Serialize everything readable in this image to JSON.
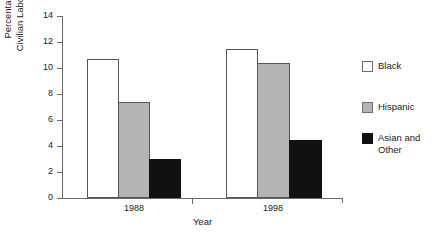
{
  "chart_data": {
    "type": "bar",
    "title": "",
    "xlabel": "Year",
    "ylabel": "Percentage of Civilian Labor Force",
    "ylabel_lines": [
      "Percentage of",
      "Civilian Labor Force"
    ],
    "categories": [
      "1988",
      "1998"
    ],
    "series": [
      {
        "name": "Black",
        "values": [
          10.7,
          11.5
        ],
        "color": "#ffffff"
      },
      {
        "name": "Hispanic",
        "values": [
          7.4,
          10.4
        ],
        "color": "#b4b4b4"
      },
      {
        "name": "Asian and Other",
        "values": [
          3.0,
          4.5
        ],
        "color": "#111111"
      }
    ],
    "ylim": [
      0,
      14
    ],
    "yticks": [
      0,
      2,
      4,
      6,
      8,
      10,
      12,
      14
    ],
    "ytick_labels": [
      "0",
      "2",
      "4",
      "6",
      "8",
      "10",
      "12",
      "14"
    ],
    "grid": false,
    "legend_position": "right",
    "legend_entries": [
      {
        "label": "Black",
        "label_lines": [
          "Black"
        ],
        "swatch": "white"
      },
      {
        "label": "Hispanic",
        "label_lines": [
          "Hispanic"
        ],
        "swatch": "gray"
      },
      {
        "label": "Asian and Other",
        "label_lines": [
          "Asian and",
          "Other"
        ],
        "swatch": "black"
      }
    ]
  }
}
